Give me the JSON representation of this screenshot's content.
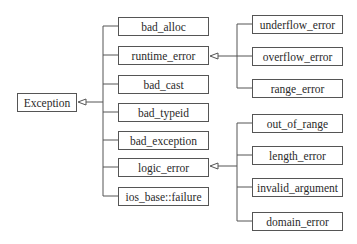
{
  "diagram": {
    "root": {
      "id": "exception",
      "label": "Exception",
      "x": 17,
      "y": 93,
      "w": 60,
      "h": 19
    },
    "level1": [
      {
        "id": "bad_alloc",
        "label": "bad_alloc",
        "x": 118,
        "y": 17,
        "w": 91,
        "h": 19
      },
      {
        "id": "runtime_error",
        "label": "runtime_error",
        "x": 118,
        "y": 46,
        "w": 91,
        "h": 19
      },
      {
        "id": "bad_cast",
        "label": "bad_cast",
        "x": 118,
        "y": 75,
        "w": 91,
        "h": 19
      },
      {
        "id": "bad_typeid",
        "label": "bad_typeid",
        "x": 118,
        "y": 103,
        "w": 91,
        "h": 19
      },
      {
        "id": "bad_exception",
        "label": "bad_exception",
        "x": 118,
        "y": 131,
        "w": 91,
        "h": 19
      },
      {
        "id": "logic_error",
        "label": "logic_error",
        "x": 118,
        "y": 158,
        "w": 91,
        "h": 19
      },
      {
        "id": "ios_base_failure",
        "label": "ios_base::failure",
        "x": 118,
        "y": 187,
        "w": 91,
        "h": 19
      }
    ],
    "runtime_error_children": [
      {
        "id": "underflow_error",
        "label": "underflow_error",
        "x": 252,
        "y": 15,
        "w": 91,
        "h": 19
      },
      {
        "id": "overflow_error",
        "label": "overflow_error",
        "x": 252,
        "y": 47,
        "w": 91,
        "h": 19
      },
      {
        "id": "range_error",
        "label": "range_error",
        "x": 252,
        "y": 79,
        "w": 91,
        "h": 19
      }
    ],
    "logic_error_children": [
      {
        "id": "out_of_range",
        "label": "out_of_range",
        "x": 252,
        "y": 114,
        "w": 91,
        "h": 19
      },
      {
        "id": "length_error",
        "label": "length_error",
        "x": 252,
        "y": 146,
        "w": 91,
        "h": 19
      },
      {
        "id": "invalid_argument",
        "label": "invalid_argument",
        "x": 252,
        "y": 178,
        "w": 91,
        "h": 19
      },
      {
        "id": "domain_error",
        "label": "domain_error",
        "x": 252,
        "y": 212,
        "w": 91,
        "h": 19
      }
    ],
    "edges": [
      {
        "from": "bad_alloc",
        "to": "exception"
      },
      {
        "from": "runtime_error",
        "to": "exception"
      },
      {
        "from": "bad_cast",
        "to": "exception"
      },
      {
        "from": "bad_typeid",
        "to": "exception"
      },
      {
        "from": "bad_exception",
        "to": "exception"
      },
      {
        "from": "logic_error",
        "to": "exception"
      },
      {
        "from": "ios_base_failure",
        "to": "exception"
      },
      {
        "from": "underflow_error",
        "to": "runtime_error"
      },
      {
        "from": "overflow_error",
        "to": "runtime_error"
      },
      {
        "from": "range_error",
        "to": "runtime_error"
      },
      {
        "from": "out_of_range",
        "to": "logic_error"
      },
      {
        "from": "length_error",
        "to": "logic_error"
      },
      {
        "from": "invalid_argument",
        "to": "logic_error"
      },
      {
        "from": "domain_error",
        "to": "logic_error"
      }
    ],
    "edge_style": "UML generalization (hollow triangle arrowhead)",
    "colors": {
      "line": "#555555",
      "text": "#2a2a2a",
      "background": "#ffffff"
    }
  }
}
